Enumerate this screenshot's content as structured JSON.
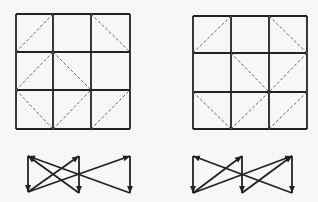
{
  "colors": {
    "background": "#f7f7f5",
    "line": "#222222",
    "dashed": "#666666"
  },
  "panels": [
    {
      "name": "left",
      "grid": {
        "x": [
          16,
          53,
          91,
          130
        ],
        "y": [
          14,
          52,
          90,
          129
        ]
      },
      "dashed": [
        [
          16,
          52,
          53,
          14
        ],
        [
          91,
          14,
          130,
          52
        ],
        [
          16,
          90,
          53,
          52
        ],
        [
          53,
          52,
          91,
          90
        ],
        [
          16,
          90,
          53,
          129
        ],
        [
          53,
          129,
          91,
          90
        ],
        [
          91,
          129,
          130,
          90
        ]
      ],
      "graph": {
        "nodes": {
          "TL": [
            28,
            156
          ],
          "BL": [
            28,
            192
          ],
          "TM": [
            79,
            156
          ],
          "BM": [
            79,
            193
          ],
          "TR": [
            130,
            156
          ],
          "BR": [
            130,
            193
          ]
        },
        "arrows": [
          [
            "TL",
            "BL"
          ],
          [
            "BL",
            "TM"
          ],
          [
            "TM",
            "BM"
          ],
          [
            "BM",
            "TL"
          ],
          [
            "BL",
            "TR"
          ],
          [
            "TR",
            "BR"
          ],
          [
            "BR",
            "TL"
          ]
        ]
      }
    },
    {
      "name": "right",
      "grid": {
        "x": [
          193,
          231,
          269,
          307
        ],
        "y": [
          16,
          53,
          92,
          129
        ]
      },
      "dashed": [
        [
          193,
          53,
          231,
          16
        ],
        [
          269,
          16,
          307,
          53
        ],
        [
          231,
          53,
          269,
          92
        ],
        [
          307,
          53,
          269,
          92
        ],
        [
          193,
          92,
          231,
          129
        ],
        [
          231,
          129,
          269,
          92
        ],
        [
          269,
          129,
          307,
          92
        ]
      ],
      "graph": {
        "nodes": {
          "TL": [
            193,
            156
          ],
          "BL": [
            193,
            193
          ],
          "TM": [
            242,
            156
          ],
          "BM": [
            242,
            193
          ],
          "TR": [
            292,
            156
          ],
          "BR": [
            292,
            193
          ]
        },
        "arrows": [
          [
            "TL",
            "BL"
          ],
          [
            "BL",
            "TM"
          ],
          [
            "TM",
            "BM"
          ],
          [
            "BL",
            "TR"
          ],
          [
            "BM",
            "TR"
          ],
          [
            "TR",
            "BR"
          ],
          [
            "BR",
            "TL"
          ]
        ]
      }
    }
  ]
}
